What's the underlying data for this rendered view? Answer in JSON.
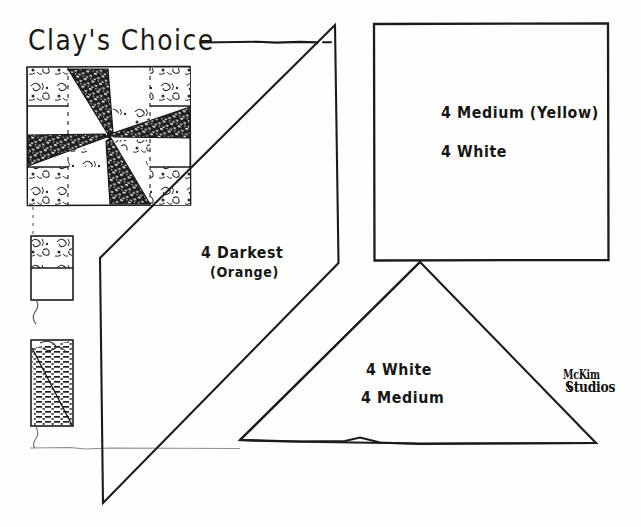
{
  "page": {
    "title": "Clay's Choice",
    "title_rule": "long-dash-after-title",
    "background": "#fefefc",
    "ink": "#181818"
  },
  "block_diagram": {
    "name": "Clay's Choice pieced quilt block",
    "description": "Four-patch star / pinwheel block with four dark pinwheel blades, four medium print corner squares and white background squares, drawn with dotted construction grid lines.",
    "grid": "4x4",
    "fabrics": [
      "Darkest (Orange)",
      "Medium (Yellow)",
      "White"
    ]
  },
  "swatches": [
    {
      "name": "swatch-medium-print",
      "fill": "print-top-white-bottom"
    },
    {
      "name": "swatch-dark-hatch",
      "fill": "diagonal-dark-hatched"
    }
  ],
  "pieces": [
    {
      "id": "parallelogram",
      "shape": "parallelogram",
      "label_line1": "4 Darkest",
      "label_line2": "(Orange)"
    },
    {
      "id": "square",
      "shape": "square",
      "label_line1": "4 Medium (Yellow)",
      "label_line2": "4 White"
    },
    {
      "id": "triangle",
      "shape": "triangle",
      "label_line1": "4 White",
      "label_line2": "4 Medium"
    }
  ],
  "signature": {
    "line1": "McKim",
    "line2": "Studios"
  }
}
